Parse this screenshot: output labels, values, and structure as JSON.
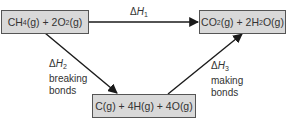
{
  "diagram": {
    "nodes": {
      "reactants": {
        "parts": [
          "CH",
          "4",
          "(g) + 2O",
          "2",
          "(g)"
        ]
      },
      "products": {
        "parts": [
          "CO",
          "2",
          "(g) + 2H",
          "2",
          "O(g)"
        ]
      },
      "atoms": {
        "text": "C(g) + 4H(g) + 4O(g)"
      }
    },
    "edges": {
      "dh1": {
        "delta": "Δ",
        "symbol": "H",
        "sub": "1"
      },
      "dh2": {
        "delta": "Δ",
        "symbol": "H",
        "sub": "2",
        "line1": "breaking",
        "line2": "bonds"
      },
      "dh3": {
        "delta": "Δ",
        "symbol": "H",
        "sub": "3",
        "line1": "making",
        "line2": "bonds"
      }
    },
    "colors": {
      "box_fill": "#d9d9d9",
      "box_border": "#555555",
      "arrow": "#1a1a1a"
    }
  }
}
